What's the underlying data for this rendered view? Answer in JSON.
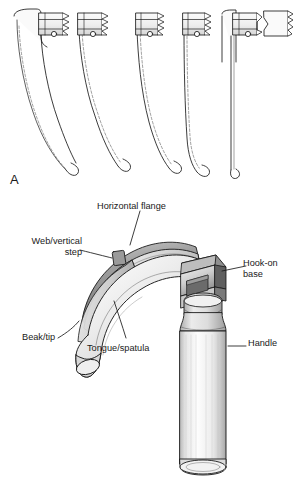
{
  "figure": {
    "background_color": "#ffffff",
    "line_color": "#1a1a1a",
    "label_color": "#1a1a1a"
  },
  "panels": [
    {
      "letter": "A",
      "name": "blade-profiles",
      "description": "Five laryngoscope blade side profiles, decreasing in size from left to right, ending with a straight blade",
      "blades": [
        {
          "index": 1,
          "type": "curved",
          "label": ""
        },
        {
          "index": 2,
          "type": "curved",
          "label": ""
        },
        {
          "index": 3,
          "type": "curved",
          "label": ""
        },
        {
          "index": 4,
          "type": "curved",
          "label": ""
        },
        {
          "index": 5,
          "type": "straight",
          "label": ""
        }
      ]
    },
    {
      "letter": "B",
      "name": "labeled-laryngoscope",
      "description": "Three-dimensional drawing of an assembled Macintosh laryngoscope blade on a handle with part callouts"
    }
  ],
  "callouts": [
    {
      "id": "horizontal-flange",
      "text": "Horizontal flange"
    },
    {
      "id": "web-vertical-step",
      "text": "Web/vertical\nstep"
    },
    {
      "id": "beak-tip",
      "text": "Beak/tip"
    },
    {
      "id": "tongue-spatula",
      "text": "Tongue/spatula"
    },
    {
      "id": "hook-on-base",
      "text": "Hook-on\nbase"
    },
    {
      "id": "handle",
      "text": "Handle"
    }
  ],
  "colors": {
    "outline": "#1a1a1a",
    "metal_light": "#f2f2f2",
    "metal_mid": "#d2d2d2",
    "metal_dark": "#9a9a9a",
    "metal_shadow": "#6e6e6e",
    "web_step_marker": "#8c8c8c"
  }
}
